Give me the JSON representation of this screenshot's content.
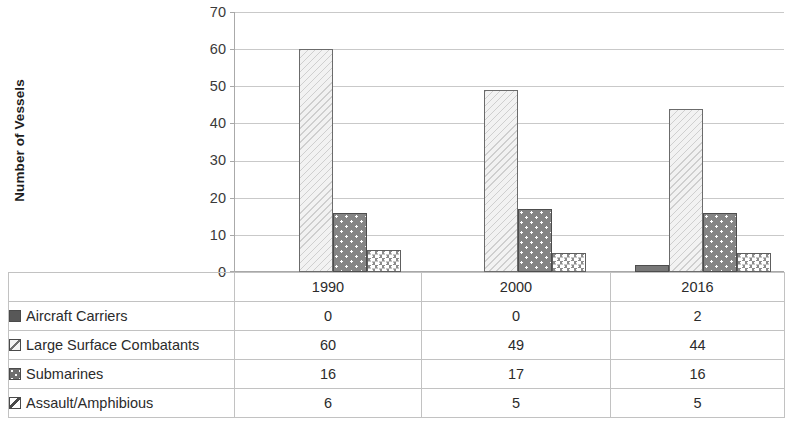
{
  "chart_data": {
    "type": "bar",
    "title": "",
    "xlabel": "",
    "ylabel": "Number of Vessels",
    "ylim": [
      0,
      70
    ],
    "ytick_step": 10,
    "yticks": [
      70,
      60,
      50,
      40,
      30,
      20,
      10,
      0
    ],
    "grid": true,
    "legend_position": "data-table",
    "categories": [
      "1990",
      "2000",
      "2016"
    ],
    "series": [
      {
        "name": "Aircraft Carriers",
        "values": [
          0,
          0,
          2
        ],
        "pattern": "solid-dark-gray",
        "color": "#787878"
      },
      {
        "name": "Large Surface Combatants",
        "values": [
          60,
          49,
          44
        ],
        "pattern": "diagonal-hatch",
        "color": "#f2f2f2"
      },
      {
        "name": "Submarines",
        "values": [
          16,
          17,
          16
        ],
        "pattern": "dots-on-gray",
        "color": "#858585"
      },
      {
        "name": "Assault/Amphibious",
        "values": [
          6,
          5,
          5
        ],
        "pattern": "zigzag-wave",
        "color": "#ffffff"
      }
    ]
  },
  "axis": {
    "y_title": "Number of Vessels",
    "y_ticks": [
      "70",
      "60",
      "50",
      "40",
      "30",
      "20",
      "10",
      "0"
    ]
  },
  "table": {
    "corner_label": "",
    "year_headers": [
      "1990",
      "2000",
      "2016"
    ],
    "rows": [
      {
        "label": "Aircraft Carriers",
        "swatch": "carriers-swatch-icon",
        "values": [
          "0",
          "0",
          "2"
        ]
      },
      {
        "label": "Large Surface Combatants",
        "swatch": "lsc-swatch-icon",
        "values": [
          "60",
          "49",
          "44"
        ]
      },
      {
        "label": "Submarines",
        "swatch": "subs-swatch-icon",
        "values": [
          "16",
          "17",
          "16"
        ]
      },
      {
        "label": "Assault/Amphibious",
        "swatch": "assault-swatch-icon",
        "values": [
          "6",
          "5",
          "5"
        ]
      }
    ]
  }
}
